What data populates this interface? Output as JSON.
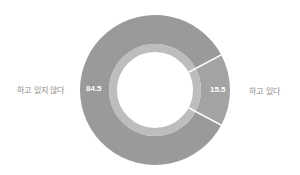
{
  "chart_data": {
    "type": "pie",
    "subtype": "donut",
    "title": "",
    "categories": [
      "하고 있지 않다",
      "하고 있다"
    ],
    "values": [
      84.5,
      15.5
    ],
    "labels_outside": [
      "하고 있지 않다",
      "하고 있다"
    ],
    "value_labels": [
      "84.5",
      "15.5"
    ],
    "colors": [
      "#9a9a9a",
      "#a3a3a3"
    ],
    "inner_ring_color": "#bdbdbd",
    "separator_color": "#ffffff",
    "legend": "none"
  },
  "labels": {
    "left": "하고 있지 않다",
    "right": "하고 있다"
  },
  "values_text": {
    "left": "84.5",
    "right": "15.5"
  }
}
